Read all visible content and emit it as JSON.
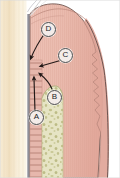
{
  "figure": {
    "width": 120,
    "height": 178
  },
  "labels": [
    {
      "id": "A",
      "text": "A",
      "x": 29,
      "y": 110,
      "describes": "periodontal-ligament-vessels"
    },
    {
      "id": "B",
      "text": "B",
      "x": 47,
      "y": 90,
      "describes": "alveolar-bone-vessels"
    },
    {
      "id": "C",
      "text": "C",
      "x": 58,
      "y": 48,
      "describes": "supraperiosteal-vessels"
    },
    {
      "id": "D",
      "text": "D",
      "x": 41,
      "y": 22,
      "describes": "gingival-crest-vessels"
    }
  ],
  "regions": [
    {
      "name": "tooth-enamel-dentin",
      "label": "tooth",
      "color": "#f2e3c8"
    },
    {
      "name": "cementum-line",
      "label": "cementum",
      "color": "#8b8b93"
    },
    {
      "name": "periodontal-ligament",
      "label": "periodontal ligament",
      "color": "#e9bfb4"
    },
    {
      "name": "alveolar-bone",
      "label": "alveolar bone",
      "color": "#e3e1c0"
    },
    {
      "name": "gingiva-connective-tissue",
      "label": "gingiva",
      "color": "#e8b9ad"
    },
    {
      "name": "gingival-epithelium",
      "label": "epithelium",
      "color": "#dfa89c"
    }
  ],
  "arrows": [
    {
      "name": "arrow-from-D",
      "from": "D",
      "direction": "down-left"
    },
    {
      "name": "arrow-from-C",
      "from": "C",
      "direction": "left"
    },
    {
      "name": "arrow-from-B",
      "from": "B",
      "direction": "up-left"
    },
    {
      "name": "arrow-from-A",
      "from": "A",
      "direction": "up"
    }
  ],
  "colors": {
    "background": "#ffffff",
    "outline": "#5a4a48",
    "arrow": "#231a18",
    "label_fill": "#f3ece9",
    "label_stroke": "#4a4a4a",
    "tooth": "#f2e3c8",
    "tooth_light": "#fdf6e8",
    "cementum": "#8b8b93",
    "pdl": "#e9bfb4",
    "pdl_fiber": "#a66a5e",
    "bone": "#e3e1c0",
    "bone_speckle": "#b6b57c",
    "gingiva": "#e8b9ad",
    "gingiva_dark": "#d79a8d",
    "gingiva_stripe": "#dca79a"
  }
}
